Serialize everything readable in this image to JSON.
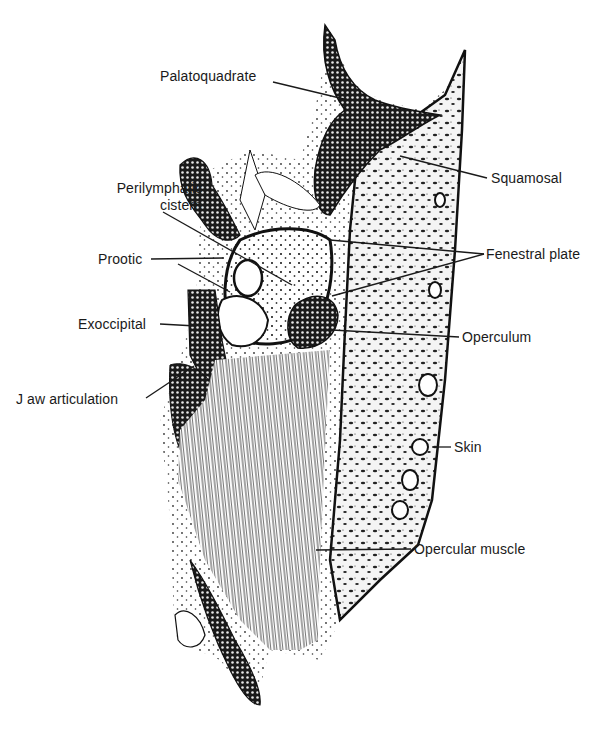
{
  "figure": {
    "type": "anatomical-section-drawing",
    "colors": {
      "ink": "#1a1a1a",
      "background": "#ffffff"
    }
  },
  "labels": [
    {
      "id": "palatoquadrate",
      "text": "Palatoquadrate",
      "x": 160,
      "y": 66,
      "target": [
        348,
        100
      ]
    },
    {
      "id": "squamosal",
      "text": "Squamosal",
      "x": 491,
      "y": 172,
      "target": [
        400,
        156
      ]
    },
    {
      "id": "perilymphatic-cistern",
      "text": "Perilymphatic\ncistern",
      "x": 92,
      "y": 180,
      "target": [
        292,
        285
      ]
    },
    {
      "id": "fenestral-plate",
      "text": "Fenestral plate",
      "x": 486,
      "y": 248,
      "targets": [
        [
          330,
          240
        ],
        [
          332,
          296
        ]
      ]
    },
    {
      "id": "prootic",
      "text": "Prootic",
      "x": 98,
      "y": 252,
      "targets": [
        [
          224,
          258
        ],
        [
          230,
          292
        ]
      ]
    },
    {
      "id": "exoccipital",
      "text": "Exoccipital",
      "x": 78,
      "y": 318,
      "target": [
        196,
        326
      ]
    },
    {
      "id": "operculum",
      "text": "Operculum",
      "x": 462,
      "y": 330,
      "target": [
        332,
        330
      ]
    },
    {
      "id": "jaw-articulation",
      "text": "J aw  articulation",
      "x": 16,
      "y": 392,
      "target": [
        194,
        366
      ]
    },
    {
      "id": "skin",
      "text": "Skin",
      "x": 454,
      "y": 440,
      "target": [
        432,
        447
      ]
    },
    {
      "id": "opercular-muscle",
      "text": "Opercular muscle",
      "x": 414,
      "y": 542,
      "target": [
        316,
        550
      ]
    }
  ]
}
